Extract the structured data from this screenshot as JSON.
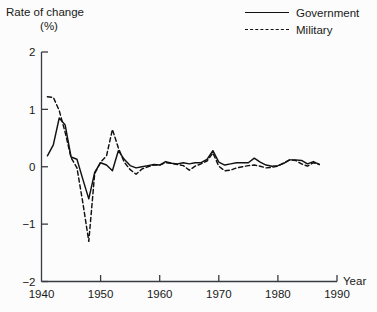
{
  "chart_data": {
    "type": "line",
    "title": "",
    "xlabel": "Year",
    "ylabel": "Rate of change (%)",
    "ylabel_line1": "Rate of change",
    "ylabel_line2": "(%)",
    "xlim": [
      1940,
      1990
    ],
    "ylim": [
      -2,
      2
    ],
    "grid": false,
    "legend_position": "top-right",
    "xticks": [
      1940,
      1950,
      1960,
      1970,
      1980,
      1990
    ],
    "xtick_labels": [
      "1940",
      "1950",
      "1960",
      "1970",
      "1980",
      "1990"
    ],
    "yticks": [
      -2,
      -1,
      0,
      1,
      2
    ],
    "ytick_labels": [
      "−2",
      "−1",
      "0",
      "1",
      "2"
    ],
    "x": [
      1941,
      1942,
      1943,
      1944,
      1945,
      1946,
      1947,
      1948,
      1949,
      1950,
      1951,
      1952,
      1953,
      1954,
      1955,
      1956,
      1957,
      1958,
      1959,
      1960,
      1961,
      1962,
      1963,
      1964,
      1965,
      1966,
      1967,
      1968,
      1969,
      1970,
      1971,
      1972,
      1973,
      1974,
      1975,
      1976,
      1977,
      1978,
      1979,
      1980,
      1981,
      1982,
      1983,
      1984,
      1985,
      1986,
      1987
    ],
    "series": [
      {
        "name": "Government",
        "style": "solid",
        "color": "#111111",
        "values": [
          0.19,
          0.38,
          0.85,
          0.73,
          0.17,
          0.13,
          -0.22,
          -0.56,
          -0.1,
          0.07,
          0.03,
          -0.07,
          0.28,
          0.13,
          0.02,
          -0.02,
          0.0,
          0.02,
          0.04,
          0.03,
          0.09,
          0.06,
          0.05,
          0.07,
          0.05,
          0.07,
          0.07,
          0.13,
          0.28,
          0.08,
          0.03,
          0.05,
          0.07,
          0.07,
          0.07,
          0.15,
          0.08,
          0.03,
          0.01,
          0.02,
          0.06,
          0.12,
          0.12,
          0.11,
          0.05,
          0.09,
          0.04
        ]
      },
      {
        "name": "Military",
        "style": "dashed",
        "color": "#111111",
        "values": [
          1.22,
          1.21,
          0.98,
          0.6,
          0.16,
          -0.02,
          -0.63,
          -1.3,
          -0.12,
          0.08,
          0.19,
          0.65,
          0.33,
          0.08,
          -0.05,
          -0.13,
          -0.04,
          0.0,
          0.03,
          0.03,
          0.07,
          0.06,
          0.04,
          0.02,
          -0.06,
          0.01,
          0.05,
          0.1,
          0.24,
          0.01,
          -0.07,
          -0.06,
          -0.02,
          0.0,
          0.02,
          0.03,
          0.01,
          -0.02,
          -0.01,
          0.01,
          0.07,
          0.12,
          0.11,
          0.05,
          0.01,
          0.07,
          0.04
        ]
      }
    ]
  },
  "legend": {
    "items": [
      {
        "label": "Government",
        "style": "solid"
      },
      {
        "label": "Military",
        "style": "dashed"
      }
    ]
  },
  "axes": {
    "y_title_line1": "Rate of change",
    "y_title_line2": "(%)",
    "x_title": "Year"
  }
}
